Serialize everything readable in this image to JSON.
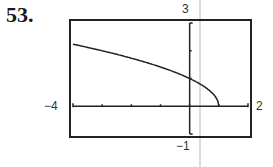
{
  "problem_number": "53.",
  "labels": {
    "ymax": "3",
    "ymin": "−1",
    "xmin": "−4",
    "xmax": "2"
  },
  "chart_data": {
    "type": "line",
    "title": "",
    "xlabel": "",
    "ylabel": "",
    "xlim": [
      -4,
      2
    ],
    "ylim": [
      -1,
      3
    ],
    "grid": false,
    "x_ticks": [
      -3,
      -2,
      -1,
      0,
      1
    ],
    "y_ticks": [
      1,
      2
    ],
    "series": [
      {
        "name": "y = sqrt(1 - x)",
        "x": [
          -4,
          -3,
          -2,
          -1,
          0,
          0.5,
          0.8,
          0.95,
          1
        ],
        "y": [
          2.24,
          2.0,
          1.73,
          1.41,
          1.0,
          0.71,
          0.45,
          0.22,
          0
        ]
      }
    ]
  }
}
